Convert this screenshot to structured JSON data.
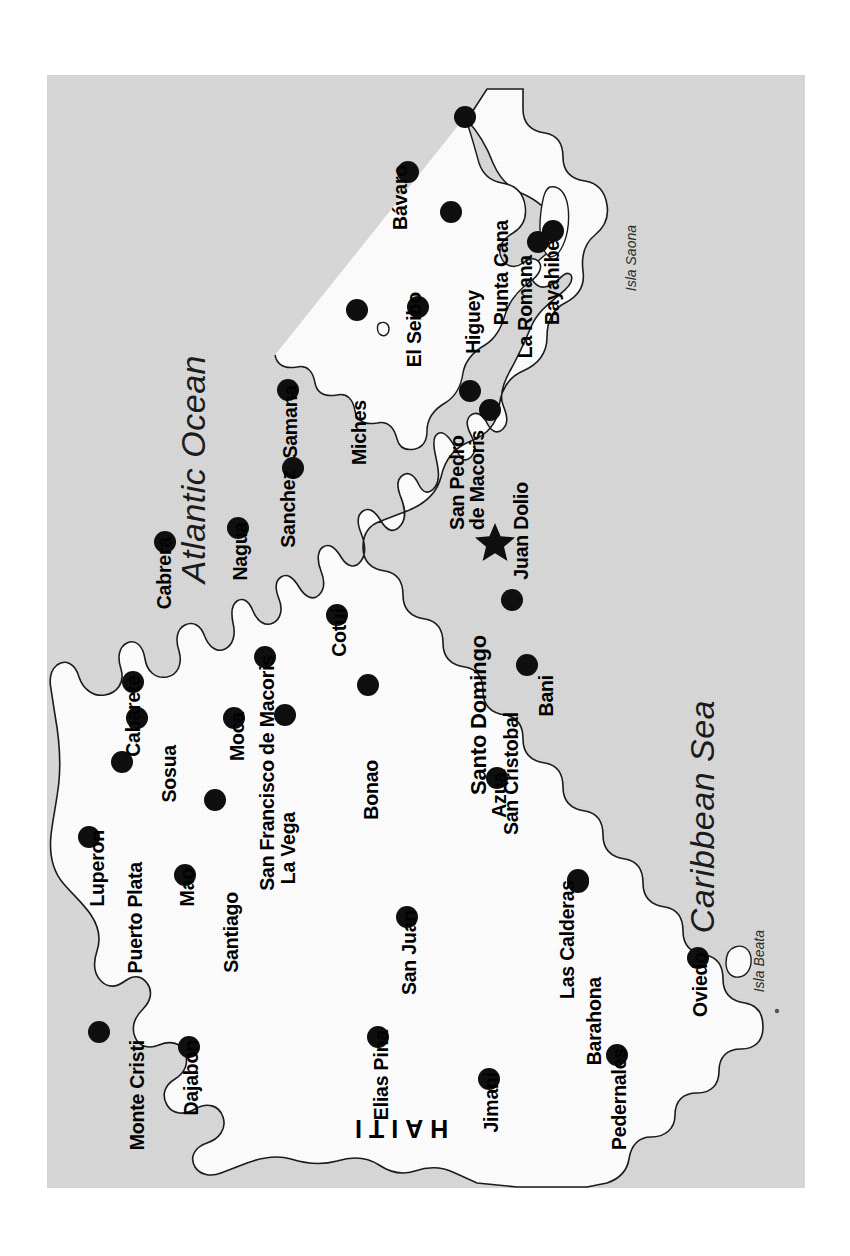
{
  "map": {
    "title": "Dominican Republic Tourist Map",
    "plate": {
      "x": 47,
      "y": 75,
      "width": 758,
      "height": 1113
    },
    "colors": {
      "sea": "#d9d9d9",
      "land": "#ffffff",
      "coastline": "#1a1a1a",
      "marker": "#0d0d0d",
      "label": "#000000",
      "page_background": "#ffffff"
    },
    "orientation_note": "Map is rotated 90 degrees; all place labels read bottom-to-top",
    "water_labels": [
      {
        "name": "Atlantic Ocean",
        "x": 176,
        "y": 355,
        "font_size": 34,
        "style": "italic"
      },
      {
        "name": "Caribbean Sea",
        "x": 685,
        "y": 700,
        "font_size": 34,
        "style": "italic"
      }
    ],
    "island_labels": [
      {
        "name": "Isla Saona",
        "x": 624,
        "y": 225,
        "font_size": 14,
        "style": "italic"
      },
      {
        "name": "Isla Beata",
        "x": 752,
        "y": 930,
        "font_size": 14,
        "style": "italic"
      }
    ],
    "country_labels": [
      {
        "name": "HAITI",
        "x": 348,
        "y": 1115,
        "font_size": 25,
        "rotation": 180
      }
    ],
    "capital": {
      "name": "Santo Domingo",
      "marker": "star",
      "dot_x": 493,
      "dot_y": 540,
      "label_x": 468,
      "label_y": 635
    },
    "cities": [
      {
        "name": "Bavaro",
        "display": "Bávaro",
        "dot_x": 408,
        "dot_y": 172,
        "label_x": 391,
        "label_y": 165
      },
      {
        "name": "Punta Cana",
        "display": "Punta Cana",
        "dot_x": 465,
        "dot_y": 117,
        "label_x": 492,
        "label_y": 220
      },
      {
        "name": "El Seibo",
        "display": "El Seibo",
        "dot_x": 418,
        "dot_y": 307,
        "label_x": 405,
        "label_y": 292
      },
      {
        "name": "Higuey",
        "display": "Higuey",
        "dot_x": 451,
        "dot_y": 212,
        "label_x": 464,
        "label_y": 290
      },
      {
        "name": "La Romana",
        "display": "La Romana",
        "dot_x": 538,
        "dot_y": 242,
        "label_x": 516,
        "label_y": 255
      },
      {
        "name": "Bayahibe",
        "display": "Bayahibe",
        "dot_x": 553,
        "dot_y": 231,
        "label_x": 543,
        "label_y": 240
      },
      {
        "name": "Miches",
        "display": "Miches",
        "dot_x": 357,
        "dot_y": 310,
        "label_x": 350,
        "label_y": 400
      },
      {
        "name": "Samana",
        "display": "Samana",
        "dot_x": 288,
        "dot_y": 390,
        "label_x": 281,
        "label_y": 385
      },
      {
        "name": "Sanchez",
        "display": "Sanchez",
        "dot_x": 293,
        "dot_y": 468,
        "label_x": 279,
        "label_y": 470
      },
      {
        "name": "San Francisco de Macoris",
        "display": "San Francisco de Macoris",
        "dot_x": 265,
        "dot_y": 657,
        "label_x": 258,
        "label_y": 655
      },
      {
        "name": "Nagua",
        "display": "Nagua",
        "dot_x": 238,
        "dot_y": 528,
        "label_x": 231,
        "label_y": 522
      },
      {
        "name": "Cabrera",
        "display": "Cabrera",
        "dot_x": 165,
        "dot_y": 542,
        "label_x": 155,
        "label_y": 537
      },
      {
        "name": "Cabarete",
        "display": "Cabarete",
        "dot_x": 133,
        "dot_y": 682,
        "label_x": 124,
        "label_y": 675
      },
      {
        "name": "Sosua",
        "display": "Sosua",
        "dot_x": 137,
        "dot_y": 718,
        "label_x": 160,
        "label_y": 745
      },
      {
        "name": "Puerto Plata",
        "display": "Puerto Plata",
        "dot_x": 122,
        "dot_y": 762,
        "label_x": 126,
        "label_y": 862
      },
      {
        "name": "Luperon",
        "display": "Luperon",
        "dot_x": 89,
        "dot_y": 837,
        "label_x": 88,
        "label_y": 830
      },
      {
        "name": "Monte Cristi",
        "display": "Monte Cristi",
        "dot_x": 99,
        "dot_y": 1032,
        "label_x": 128,
        "label_y": 1040
      },
      {
        "name": "Dajabon",
        "display": "Dajabon",
        "dot_x": 189,
        "dot_y": 1047,
        "label_x": 182,
        "label_y": 1040
      },
      {
        "name": "Mao",
        "display": "Mao",
        "dot_x": 185,
        "dot_y": 875,
        "label_x": 178,
        "label_y": 868
      },
      {
        "name": "Santiago",
        "display": "Santiago",
        "dot_x": 215,
        "dot_y": 800,
        "label_x": 222,
        "label_y": 892
      },
      {
        "name": "Moca",
        "display": "Moca",
        "dot_x": 234,
        "dot_y": 718,
        "label_x": 228,
        "label_y": 712
      },
      {
        "name": "La Vega",
        "display": "La Vega",
        "dot_x": 285,
        "dot_y": 715,
        "label_x": 279,
        "label_y": 812
      },
      {
        "name": "Bonao",
        "display": "Bonao",
        "dot_x": 368,
        "dot_y": 685,
        "label_x": 362,
        "label_y": 760
      },
      {
        "name": "Cotui",
        "display": "Cotui",
        "dot_x": 337,
        "dot_y": 615,
        "label_x": 330,
        "label_y": 608
      },
      {
        "name": "San Juan",
        "display": "San Juan",
        "dot_x": 407,
        "dot_y": 917,
        "label_x": 400,
        "label_y": 910
      },
      {
        "name": "Elias Pina",
        "display": "Elias Pina",
        "dot_x": 378,
        "dot_y": 1037,
        "label_x": 372,
        "label_y": 1030
      },
      {
        "name": "Jimani",
        "display": "Jimani",
        "dot_x": 489,
        "dot_y": 1079,
        "label_x": 482,
        "label_y": 1072
      },
      {
        "name": "Azua",
        "display": "Azua",
        "dot_x": 497,
        "dot_y": 778,
        "label_x": 490,
        "label_y": 772
      },
      {
        "name": "San Cristobal",
        "display": "San Cristobal",
        "dot_x": 512,
        "dot_y": 600,
        "label_x": 502,
        "label_y": 712
      },
      {
        "name": "Bani",
        "display": "Bani",
        "dot_x": 527,
        "dot_y": 665,
        "label_x": 537,
        "label_y": 675
      },
      {
        "name": "Las Calderas",
        "display": "Las Calderas",
        "dot_x": 578,
        "dot_y": 880,
        "label_x": 558,
        "label_y": 880
      },
      {
        "name": "Barahona",
        "display": "Barahona",
        "dot_x": 578,
        "dot_y": 882,
        "label_x": 585,
        "label_y": 977
      },
      {
        "name": "Pedernales",
        "display": "Pedernales",
        "dot_x": 617,
        "dot_y": 1055,
        "label_x": 610,
        "label_y": 1048
      },
      {
        "name": "Oviedo",
        "display": "Oviedo",
        "dot_x": 698,
        "dot_y": 958,
        "label_x": 691,
        "label_y": 952
      },
      {
        "name": "San Pedro de Macoris",
        "display": "San Pedro\nde Macoris",
        "dot_x": 470,
        "dot_y": 391,
        "label_x": 447,
        "label_y": 430
      },
      {
        "name": "Juan Dolio",
        "display": "Juan Dolio",
        "dot_x": 490,
        "dot_y": 410,
        "label_x": 512,
        "label_y": 482
      }
    ]
  }
}
